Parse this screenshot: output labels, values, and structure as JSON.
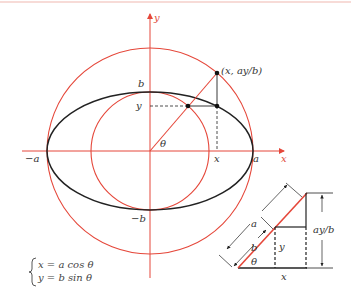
{
  "figure": {
    "colors": {
      "red": "#e5473a",
      "black": "#222222",
      "border": "#f0b8b0"
    },
    "axes": {
      "x_label": "x",
      "y_label": "y"
    },
    "labels": {
      "neg_a": "−a",
      "a": "a",
      "b": "b",
      "neg_b": "−b",
      "y_tick": "y",
      "x_tick": "x",
      "theta": "θ",
      "point": "(x, ay/b)"
    },
    "equations": {
      "line1": "x = a cos θ",
      "line2": "y = b sin θ"
    },
    "inset": {
      "a": "a",
      "b": "b",
      "y": "y",
      "x": "x",
      "theta": "θ",
      "ay_over_b": "ay/b"
    }
  }
}
